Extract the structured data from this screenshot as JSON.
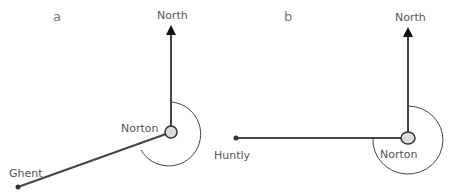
{
  "panels": [
    {
      "label": "a",
      "north_label": "North",
      "center_label": "Norton",
      "target_label": "Ghent"
    },
    {
      "label": "b",
      "north_label": "North",
      "center_label": "Norton",
      "target_label": "Huntly"
    }
  ],
  "colors": {
    "line": "#444444",
    "node_fill": "#dddddd",
    "text": "#555555"
  }
}
